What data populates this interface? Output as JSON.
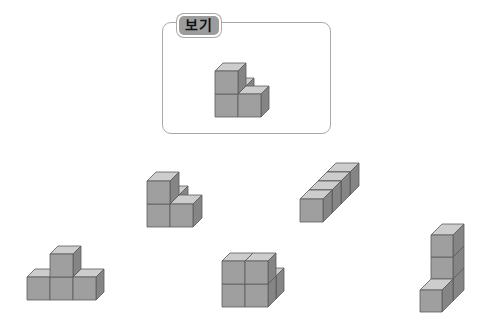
{
  "example": {
    "label": "보기"
  },
  "colors": {
    "front": "#9f9f9f",
    "top": "#cdcdcd",
    "side": "#858585",
    "edge": "#5a5a5a",
    "box_border": "#a9a9a9",
    "label_bg": "#9c9c9c"
  },
  "shapes": [
    {
      "name": "example-shape",
      "origin": [
        215,
        117
      ],
      "size": 23,
      "depth": [
        8,
        -8
      ],
      "cubes": [
        [
          0,
          0,
          1
        ],
        [
          0,
          1,
          0
        ],
        [
          1,
          0,
          0
        ],
        [
          0,
          0,
          0
        ]
      ]
    },
    {
      "name": "option-shape-a",
      "origin": [
        147,
        227
      ],
      "size": 23,
      "depth": [
        9,
        -9
      ],
      "cubes": [
        [
          0,
          0,
          1
        ],
        [
          0,
          1,
          0
        ],
        [
          1,
          0,
          0
        ],
        [
          0,
          0,
          0
        ]
      ]
    },
    {
      "name": "option-shape-b",
      "origin": [
        300,
        222
      ],
      "size": 23,
      "depth": [
        9,
        -9
      ],
      "cubes": [
        [
          0,
          3,
          0
        ],
        [
          0,
          2,
          0
        ],
        [
          0,
          1,
          0
        ],
        [
          0,
          0,
          0
        ]
      ]
    },
    {
      "name": "option-shape-c",
      "origin": [
        27,
        300
      ],
      "size": 23,
      "depth": [
        8,
        -8
      ],
      "cubes": [
        [
          0,
          0,
          0
        ],
        [
          1,
          0,
          0
        ],
        [
          2,
          0,
          0
        ],
        [
          1,
          0,
          1
        ]
      ]
    },
    {
      "name": "option-shape-d",
      "origin": [
        222,
        307
      ],
      "size": 23,
      "depth": [
        8,
        -8
      ],
      "cubes": [
        [
          1,
          1,
          0
        ],
        [
          0,
          0,
          0
        ],
        [
          1,
          0,
          0
        ],
        [
          0,
          0,
          1
        ],
        [
          1,
          0,
          1
        ]
      ]
    },
    {
      "name": "option-shape-e",
      "origin": [
        420,
        312
      ],
      "size": 22,
      "depth": [
        11,
        -11
      ],
      "cubes": [
        [
          0,
          1,
          0
        ],
        [
          0,
          1,
          1
        ],
        [
          0,
          1,
          2
        ],
        [
          0,
          0,
          0
        ]
      ]
    }
  ]
}
